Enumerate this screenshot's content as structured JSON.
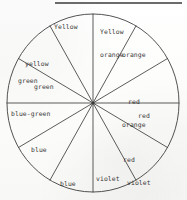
{
  "figure": {
    "type": "twelve-segment-color-wheel",
    "segment_count": 12,
    "line_color": "#3a3a3a",
    "text_color": "#2b2b2b",
    "background_color": "#fdfdfb"
  },
  "rule": {
    "present": true,
    "color": "#4a4a4a"
  },
  "wheel": {
    "center_x": 93,
    "center_y": 103,
    "radius_x": 86,
    "radius_y": 89,
    "segments": [
      {
        "name": "yellow",
        "label_line1": "Yellow",
        "label_line2": "",
        "angle_deg": 75
      },
      {
        "name": "yellow-orange",
        "label_line1": "Yellow",
        "label_line2": "orange",
        "angle_deg": 105
      },
      {
        "name": "orange",
        "label_line1": "orange",
        "label_line2": "",
        "angle_deg": 135
      },
      {
        "name": "red-orange",
        "label_line1": "red",
        "label_line2": "orange",
        "angle_deg": 165
      },
      {
        "name": "red",
        "label_line1": "red",
        "label_line2": "",
        "angle_deg": 195
      },
      {
        "name": "red-violet",
        "label_line1": "red",
        "label_line2": "violet",
        "angle_deg": 225
      },
      {
        "name": "violet",
        "label_line1": "violet",
        "label_line2": "",
        "angle_deg": 255
      },
      {
        "name": "blue-violet",
        "label_line1": "blue",
        "label_line2": "violet",
        "angle_deg": 285
      },
      {
        "name": "blue",
        "label_line1": "blue",
        "label_line2": "",
        "angle_deg": 315
      },
      {
        "name": "blue-green",
        "label_line1": "blue-green",
        "label_line2": "",
        "angle_deg": 345
      },
      {
        "name": "green",
        "label_line1": "green",
        "label_line2": "",
        "angle_deg": 15
      },
      {
        "name": "yellow-green",
        "label_line1": "yellow",
        "label_line2": "green",
        "angle_deg": 45
      }
    ]
  },
  "labels": {
    "yellow": "Yellow",
    "yellow_orange_1": "Yellow",
    "yellow_orange_2": "orange",
    "orange": "orange",
    "red_orange_1": "red",
    "red_orange_2": "orange",
    "red": "red",
    "red_violet_1": "red",
    "red_violet_2": "violet",
    "violet": "violet",
    "blue_violet_1": "blue",
    "blue_violet_2": "violet",
    "blue": "blue",
    "blue_green": "blue-green",
    "green": "green",
    "yellow_green_1": "yellow",
    "yellow_green_2": "green"
  }
}
